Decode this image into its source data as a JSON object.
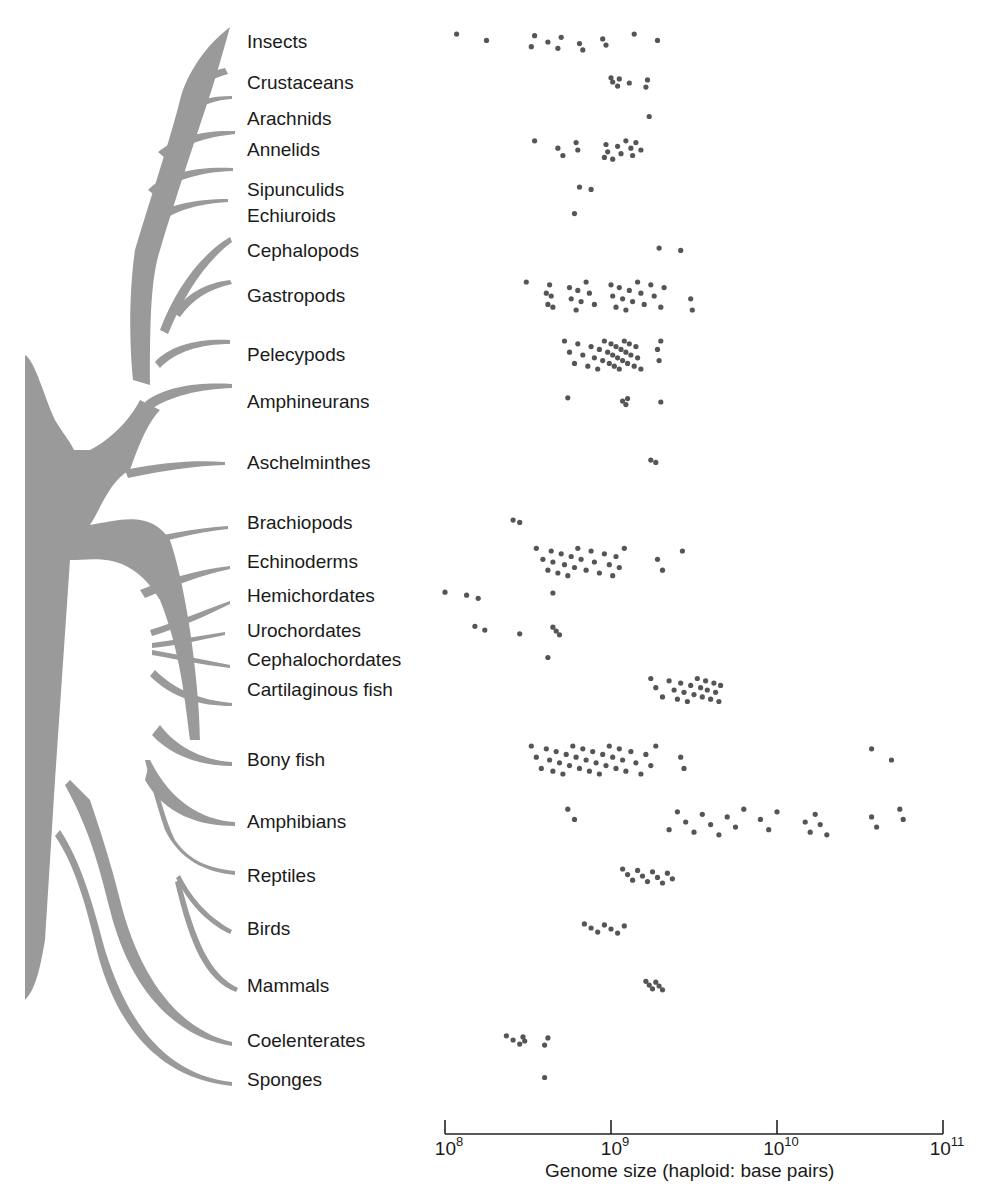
{
  "chart_data": {
    "type": "scatter",
    "title": "",
    "xlabel": "Genome size (haploid: base pairs)",
    "ylabel": "",
    "xscale": "log",
    "xlim": [
      100000000,
      100000000000
    ],
    "x_ticks": [
      {
        "base": "10",
        "exp": "8",
        "value": 100000000
      },
      {
        "base": "10",
        "exp": "9",
        "value": 1000000000
      },
      {
        "base": "10",
        "exp": "10",
        "value": 10000000000
      },
      {
        "base": "10",
        "exp": "11",
        "value": 100000000000
      }
    ],
    "grid": false,
    "legend": null,
    "point_color": "#555555",
    "tree_color": "#9a9a9a",
    "categories": [
      {
        "name": "Insects",
        "y": 42,
        "log_values": [
          8.07,
          8.25,
          8.52,
          8.54,
          8.62,
          8.68,
          8.7,
          8.81,
          8.83,
          8.95,
          8.97,
          9.14,
          9.28
        ]
      },
      {
        "name": "Crustaceans",
        "y": 83,
        "log_values": [
          9.0,
          9.01,
          9.04,
          9.05,
          9.11,
          9.21,
          9.22
        ]
      },
      {
        "name": "Arachnids",
        "y": 119,
        "log_values": [
          9.23
        ]
      },
      {
        "name": "Annelids",
        "y": 150,
        "log_values": [
          8.54,
          8.68,
          8.71,
          8.79,
          8.8,
          8.96,
          8.97,
          8.98,
          9.01,
          9.04,
          9.06,
          9.09,
          9.12,
          9.13,
          9.15,
          9.18
        ]
      },
      {
        "name": "Sipunculids",
        "y": 190,
        "log_values": [
          8.81,
          8.88
        ]
      },
      {
        "name": "Echiuroids",
        "y": 216,
        "log_values": [
          8.78
        ]
      },
      {
        "name": "Cephalopods",
        "y": 251,
        "log_values": [
          9.29,
          9.42
        ]
      },
      {
        "name": "Gastropods",
        "y": 296,
        "log_values": [
          8.49,
          8.61,
          8.62,
          8.63,
          8.64,
          8.65,
          8.75,
          8.76,
          8.79,
          8.8,
          8.82,
          8.85,
          8.87,
          8.9,
          9.0,
          9.01,
          9.03,
          9.05,
          9.07,
          9.09,
          9.11,
          9.13,
          9.16,
          9.18,
          9.2,
          9.24,
          9.26,
          9.3,
          9.32,
          9.48,
          9.49
        ]
      },
      {
        "name": "Pelecypods",
        "y": 355,
        "log_values": [
          8.72,
          8.75,
          8.78,
          8.8,
          8.83,
          8.86,
          8.88,
          8.9,
          8.92,
          8.93,
          8.95,
          8.96,
          8.98,
          8.99,
          9.0,
          9.01,
          9.02,
          9.03,
          9.04,
          9.05,
          9.06,
          9.07,
          9.08,
          9.09,
          9.1,
          9.11,
          9.12,
          9.14,
          9.15,
          9.16,
          9.18,
          9.28,
          9.29,
          9.3
        ]
      },
      {
        "name": "Amphineurans",
        "y": 402,
        "log_values": [
          8.74,
          9.07,
          9.09,
          9.1,
          9.3
        ]
      },
      {
        "name": "Aschelminthes",
        "y": 463,
        "log_values": [
          9.24,
          9.27
        ]
      },
      {
        "name": "Brachiopods",
        "y": 523,
        "log_values": [
          8.41,
          8.45
        ]
      },
      {
        "name": "Echinoderms",
        "y": 562,
        "log_values": [
          8.55,
          8.59,
          8.62,
          8.64,
          8.65,
          8.68,
          8.7,
          8.72,
          8.74,
          8.76,
          8.78,
          8.8,
          8.82,
          8.85,
          8.88,
          8.9,
          8.93,
          8.96,
          8.99,
          9.01,
          9.03,
          9.05,
          9.08,
          9.28,
          9.31,
          9.43
        ]
      },
      {
        "name": "Hemichordates",
        "y": 596,
        "log_values": [
          8.0,
          8.13,
          8.2,
          8.65
        ]
      },
      {
        "name": "Urochordates",
        "y": 631,
        "log_values": [
          8.18,
          8.24,
          8.45,
          8.65,
          8.67,
          8.69
        ]
      },
      {
        "name": "Cephalochordates",
        "y": 660,
        "log_values": [
          8.62
        ]
      },
      {
        "name": "Cartilaginous fish",
        "y": 690,
        "log_values": [
          9.24,
          9.27,
          9.31,
          9.35,
          9.38,
          9.4,
          9.42,
          9.44,
          9.46,
          9.48,
          9.5,
          9.52,
          9.54,
          9.55,
          9.57,
          9.58,
          9.6,
          9.62,
          9.63,
          9.65,
          9.66
        ]
      },
      {
        "name": "Bony fish",
        "y": 760,
        "log_values": [
          8.52,
          8.55,
          8.58,
          8.61,
          8.63,
          8.65,
          8.67,
          8.69,
          8.71,
          8.73,
          8.75,
          8.77,
          8.79,
          8.81,
          8.83,
          8.85,
          8.87,
          8.89,
          8.91,
          8.93,
          8.95,
          8.97,
          8.99,
          9.01,
          9.03,
          9.05,
          9.07,
          9.09,
          9.12,
          9.15,
          9.18,
          9.21,
          9.24,
          9.27,
          9.42,
          9.44,
          10.57,
          10.69
        ]
      },
      {
        "name": "Amphibians",
        "y": 822,
        "log_values": [
          8.74,
          8.78,
          9.35,
          9.4,
          9.45,
          9.5,
          9.55,
          9.6,
          9.65,
          9.7,
          9.75,
          9.8,
          9.9,
          9.95,
          10.0,
          10.17,
          10.2,
          10.23,
          10.26,
          10.3,
          10.57,
          10.6,
          10.74,
          10.76
        ]
      },
      {
        "name": "Reptiles",
        "y": 876,
        "log_values": [
          9.07,
          9.1,
          9.13,
          9.16,
          9.19,
          9.22,
          9.25,
          9.28,
          9.31,
          9.34,
          9.37
        ]
      },
      {
        "name": "Birds",
        "y": 929,
        "log_values": [
          8.84,
          8.88,
          8.92,
          8.96,
          9.0,
          9.04,
          9.08
        ]
      },
      {
        "name": "Mammals",
        "y": 986,
        "log_values": [
          9.21,
          9.23,
          9.25,
          9.27,
          9.29,
          9.31
        ]
      },
      {
        "name": "Coelenterates",
        "y": 1041,
        "log_values": [
          8.37,
          8.41,
          8.45,
          8.47,
          8.48,
          8.6,
          8.62
        ]
      },
      {
        "name": "Sponges",
        "y": 1080,
        "log_values": [
          8.6
        ]
      }
    ]
  }
}
